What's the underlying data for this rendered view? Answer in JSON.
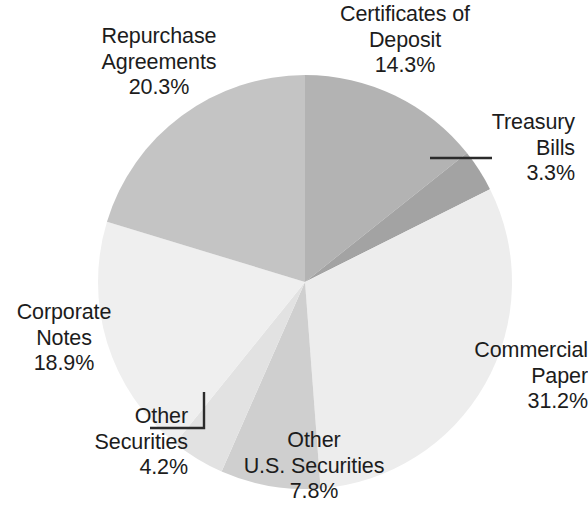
{
  "chart_data": {
    "type": "pie",
    "title": "",
    "subtitle": "",
    "xlabel": "",
    "ylabel": "",
    "legend_position": "none",
    "grid": false,
    "start_angle_deg": 0,
    "direction": "clockwise",
    "units": "percent",
    "categories": [
      "Certificates of Deposit",
      "Treasury Bills",
      "Commercial Paper",
      "Other U.S. Securities",
      "Other Securities",
      "Corporate Notes",
      "Repurchase Agreements"
    ],
    "values": [
      14.3,
      3.3,
      31.2,
      7.8,
      4.2,
      18.9,
      20.3
    ],
    "slices": [
      {
        "name": "Certificates of Deposit",
        "value": 14.3,
        "value_label": "14.3%",
        "color": "#b3b3b3",
        "label_lines": [
          "Certificates of",
          "Deposit",
          "14.3%"
        ],
        "leader_line": false
      },
      {
        "name": "Treasury Bills",
        "value": 3.3,
        "value_label": "3.3%",
        "color": "#a3a3a3",
        "label_lines": [
          "Treasury",
          "Bills",
          "3.3%"
        ],
        "leader_line": true
      },
      {
        "name": "Commercial Paper",
        "value": 31.2,
        "value_label": "31.2%",
        "color": "#ededed",
        "label_lines": [
          "Commercial",
          "Paper",
          "31.2%"
        ],
        "leader_line": false
      },
      {
        "name": "Other U.S. Securities",
        "value": 7.8,
        "value_label": "7.8%",
        "color": "#cfcfcf",
        "label_lines": [
          "Other",
          "U.S. Securities",
          "7.8%"
        ],
        "leader_line": false
      },
      {
        "name": "Other Securities",
        "value": 4.2,
        "value_label": "4.2%",
        "color": "#e2e2e2",
        "label_lines": [
          "Other",
          "Securities",
          "4.2%"
        ],
        "leader_line": true
      },
      {
        "name": "Corporate Notes",
        "value": 18.9,
        "value_label": "18.9%",
        "color": "#efefef",
        "label_lines": [
          "Corporate",
          "Notes",
          "18.9%"
        ],
        "leader_line": false
      },
      {
        "name": "Repurchase Agreements",
        "value": 20.3,
        "value_label": "20.3%",
        "color": "#c4c4c4",
        "label_lines": [
          "Repurchase",
          "Agreements",
          "20.3%"
        ],
        "leader_line": false
      }
    ],
    "background_color": "#ffffff",
    "text_color": "#1c1c1c",
    "leader_line_color": "#2b2b2b"
  },
  "labels": {
    "certificates_of_deposit": {
      "line1": "Certificates of",
      "line2": "Deposit",
      "line3": "14.3%"
    },
    "treasury_bills": {
      "line1": "Treasury",
      "line2": "Bills",
      "line3": "3.3%"
    },
    "commercial_paper": {
      "line1": "Commercial",
      "line2": "Paper",
      "line3": "31.2%"
    },
    "other_us_securities": {
      "line1": "Other",
      "line2": "U.S. Securities",
      "line3": "7.8%"
    },
    "other_securities": {
      "line1": "Other",
      "line2": "Securities",
      "line3": "4.2%"
    },
    "corporate_notes": {
      "line1": "Corporate",
      "line2": "Notes",
      "line3": "18.9%"
    },
    "repurchase_agreements": {
      "line1": "Repurchase",
      "line2": "Agreements",
      "line3": "20.3%"
    }
  }
}
